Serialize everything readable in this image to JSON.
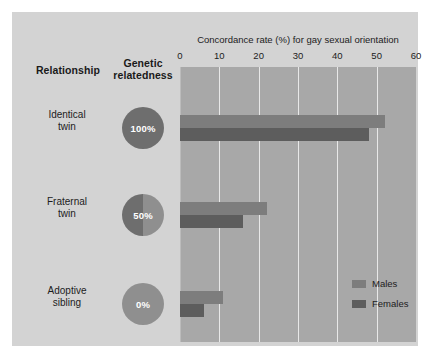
{
  "figure": {
    "background_color": "#d3d3d3",
    "plot_background_color": "#a8a8a8",
    "gridline_color": "#e8e8e8"
  },
  "table_headers": {
    "relationship": "Relationship",
    "relatedness_line1": "Genetic",
    "relatedness_line2": "relatedness"
  },
  "rows": [
    {
      "relationship_line1": "Identical",
      "relationship_line2": "twin",
      "relatedness_label": "100%",
      "relatedness_fraction": 1.0
    },
    {
      "relationship_line1": "Fraternal",
      "relationship_line2": "twin",
      "relatedness_label": "50%",
      "relatedness_fraction": 0.5
    },
    {
      "relationship_line1": "Adoptive",
      "relationship_line2": "sibling",
      "relatedness_label": "0%",
      "relatedness_fraction": 0.0
    }
  ],
  "legend": {
    "males_label": "Males",
    "females_label": "Females",
    "males_color": "#7d7d7d",
    "females_color": "#5d5d5d"
  },
  "chart_data": {
    "type": "bar",
    "orientation": "horizontal",
    "title": "Concordance rate (%) for gay sexual orientation",
    "xlabel": "Concordance rate (%)",
    "ylabel": "Relationship",
    "categories": [
      "Identical twin",
      "Fraternal twin",
      "Adoptive sibling"
    ],
    "series": [
      {
        "name": "Males",
        "color": "#7d7d7d",
        "values": [
          52,
          22,
          11
        ]
      },
      {
        "name": "Females",
        "color": "#5d5d5d",
        "values": [
          48,
          16,
          6
        ]
      }
    ],
    "xlim": [
      0,
      60
    ],
    "xticks": [
      0,
      10,
      20,
      30,
      40,
      50,
      60
    ],
    "xtick_labels": [
      "0",
      "10",
      "20",
      "30",
      "40",
      "50",
      "60"
    ],
    "grid": "vertical",
    "legend_position": "bottom-right-inside"
  }
}
